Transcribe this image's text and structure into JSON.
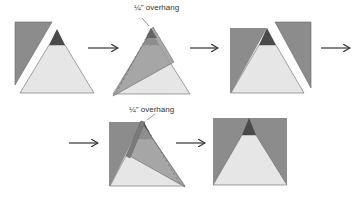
{
  "diagram": {
    "colors": {
      "dark_fabric": "#8c8c8c",
      "tip_fabric": "#4a4a4a",
      "light_fabric": "#e6e6e6",
      "overlay_fabric": "#a9a9a9",
      "outline": "#555555",
      "arrow": "#333333"
    },
    "annotations": {
      "overhang_top": "¼\" overhang",
      "overhang_bottom": "¼\" overhang"
    },
    "steps": [
      {
        "id": 1,
        "description": "Side triangle beside pieced center triangle"
      },
      {
        "id": 2,
        "description": "Side triangle placed on center with ¼\" overhang"
      },
      {
        "id": 3,
        "description": "First side sewn; second side triangle ready"
      },
      {
        "id": 4,
        "description": "Second side triangle placed with ¼\" overhang"
      },
      {
        "id": 5,
        "description": "Completed square unit"
      }
    ],
    "arrows": [
      "step1-to-step2",
      "step2-to-step3",
      "step3-next",
      "row2-into-step4",
      "step4-to-step5"
    ]
  }
}
